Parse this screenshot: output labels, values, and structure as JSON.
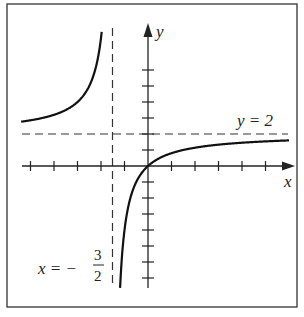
{
  "chart_data": {
    "type": "line",
    "title": "",
    "function": "y = 4x/(2x+3)",
    "xlabel": "x",
    "ylabel": "y",
    "asymptotes": {
      "vertical": {
        "x": -1.5,
        "label_lhs": "x = −",
        "label_num": "3",
        "label_den": "2"
      },
      "horizontal": {
        "y": 2,
        "label": "y = 2"
      }
    },
    "x_ticks": [
      -5,
      -4,
      -3,
      -2,
      -1,
      1,
      2,
      3,
      4,
      5
    ],
    "y_ticks": [
      -7,
      -6,
      -5,
      -4,
      -3,
      -2,
      -1,
      1,
      2,
      3,
      4,
      5,
      6
    ],
    "xlim": [
      -5.4,
      6.2
    ],
    "ylim": [
      -7.6,
      8.8
    ],
    "grid": false,
    "series": [
      {
        "name": "left branch",
        "x": [
          -5.4,
          -4,
          -3,
          -2.5,
          -2.2,
          -2.0
        ],
        "y": [
          2.77,
          3.2,
          4,
          5,
          6.29,
          8
        ]
      },
      {
        "name": "right branch",
        "x": [
          -1.19,
          -1.1,
          -1,
          -0.75,
          -0.5,
          0,
          1,
          2,
          3,
          4,
          5,
          6
        ],
        "y": [
          -7.7,
          -5.5,
          -4,
          -2,
          -1,
          0,
          0.8,
          1.14,
          1.33,
          1.45,
          1.54,
          1.6
        ]
      }
    ]
  },
  "labels": {
    "x_axis": "x",
    "y_axis": "y",
    "h_asym": "y = 2",
    "v_asym_lhs": "x = −",
    "v_asym_num": "3",
    "v_asym_den": "2"
  }
}
